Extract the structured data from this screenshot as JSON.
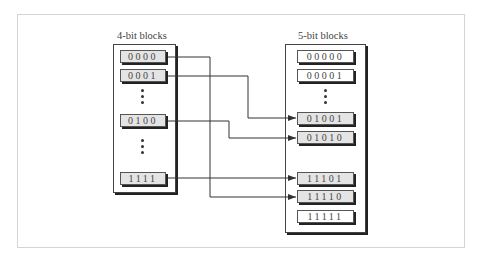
{
  "diagram": {
    "left_group": {
      "label": "4-bit blocks",
      "cells": [
        {
          "value": "0000",
          "shaded": true
        },
        {
          "value": "0001",
          "shaded": true
        },
        {
          "value": "0100",
          "shaded": true
        },
        {
          "value": "1111",
          "shaded": true
        }
      ]
    },
    "right_group": {
      "label": "5-bit blocks",
      "cells": [
        {
          "value": "00000",
          "shaded": false
        },
        {
          "value": "00001",
          "shaded": false
        },
        {
          "value": "01001",
          "shaded": true
        },
        {
          "value": "01010",
          "shaded": true
        },
        {
          "value": "11101",
          "shaded": true
        },
        {
          "value": "11110",
          "shaded": true
        },
        {
          "value": "11111",
          "shaded": false
        }
      ]
    },
    "mappings": [
      {
        "from": "0000",
        "to": "11110"
      },
      {
        "from": "0001",
        "to": "01001"
      },
      {
        "from": "0100",
        "to": "01010"
      },
      {
        "from": "1111",
        "to": "11101"
      }
    ],
    "ellipsis_glyph": "⋮"
  }
}
